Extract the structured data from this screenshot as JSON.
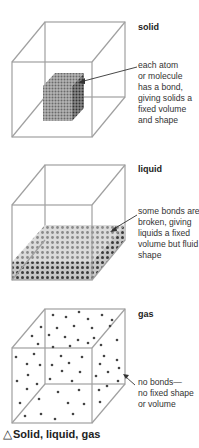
{
  "states": [
    {
      "id": "solid",
      "title": "solid",
      "note_lines": [
        "each atom",
        "or molecule",
        "has a bond,",
        "giving solids a",
        "fixed volume",
        "and shape"
      ]
    },
    {
      "id": "liquid",
      "title": "liquid",
      "note_lines": [
        "some bonds are",
        "broken, giving",
        "liquids a fixed",
        "volume but fluid",
        "shape"
      ]
    },
    {
      "id": "gas",
      "title": "gas",
      "note_lines": [
        "no bonds—",
        "no fixed shape",
        "or volume"
      ]
    }
  ],
  "caption": {
    "symbol": "△",
    "text": "Solid, liquid, gas"
  },
  "colors": {
    "cube_edge": "#9a9a9a",
    "particle_dark": "#3a3a3a",
    "particle_light": "#8c8c8c",
    "text": "#222222"
  }
}
